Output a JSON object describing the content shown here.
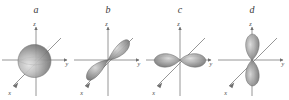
{
  "figure": {
    "background_color": "#ffffff",
    "width": 289,
    "height": 100,
    "orbital_fill_dark": "#6f6f6f",
    "orbital_fill_light": "#d8d8d8",
    "orbital_outline_color": "#5a5a5a",
    "axis_color": "#8a8a8a",
    "label_color": "#3a3a3a"
  },
  "panels": [
    {
      "label": "a",
      "orbital_type": "s",
      "orientation": "spherical",
      "axes": {
        "x": "x",
        "y": "y",
        "z": "z"
      }
    },
    {
      "label": "b",
      "orbital_type": "p",
      "orientation": "x",
      "axes": {
        "x": "x",
        "y": "y",
        "z": "z"
      }
    },
    {
      "label": "c",
      "orbital_type": "p",
      "orientation": "y",
      "axes": {
        "x": "x",
        "y": "y",
        "z": "z"
      }
    },
    {
      "label": "d",
      "orbital_type": "p",
      "orientation": "z",
      "axes": {
        "x": "x",
        "y": "y",
        "z": "z"
      }
    }
  ]
}
